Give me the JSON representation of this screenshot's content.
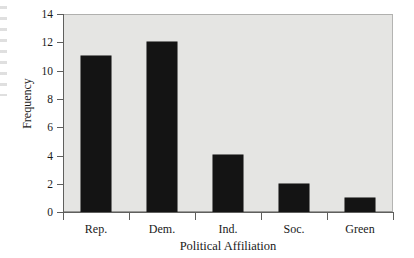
{
  "chart_data": {
    "type": "bar",
    "title": "",
    "subtitle": "",
    "xlabel": "Political Affiliation",
    "ylabel": "Frequency",
    "categories": [
      "Rep.",
      "Dem.",
      "Ind.",
      "Soc.",
      "Green"
    ],
    "values": [
      11,
      12,
      4,
      2,
      1
    ],
    "ylim": [
      0,
      14
    ],
    "ytick_values": [
      0,
      2,
      4,
      6,
      8,
      10,
      12,
      14
    ],
    "ytick_labels": [
      "0",
      "2",
      "4",
      "6",
      "8",
      "10",
      "12",
      "14"
    ],
    "xtick_labels": [
      "Rep.",
      "Dem.",
      "Ind.",
      "Soc.",
      "Green"
    ],
    "grid": false,
    "legend": false,
    "legend_position": "none",
    "bar_color": "#141414",
    "plot_background_color": "#e5e5e3",
    "axis_color": "#5f5f5d",
    "figure_background_color": "#ffffff",
    "annotations": []
  },
  "figure": {
    "y_axis_title": "Frequency",
    "x_axis_title": "Political Affiliation"
  }
}
